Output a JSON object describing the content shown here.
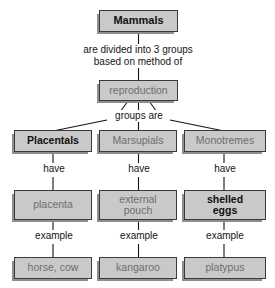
{
  "diagram": {
    "title_node": "Mammals",
    "background_color": "#ffffff",
    "box_fill_color": "#c9c9c9",
    "box_border_color": "#3a3a3a",
    "box_shadow_color": "#8e8e8e",
    "emphasis_text_color": "#111111",
    "plain_text_color": "#6e6e6e",
    "line_color": "#141414"
  },
  "nodes": {
    "root": {
      "label": "Mammals",
      "style": "emph",
      "x": 99,
      "y": 10,
      "w": 79,
      "h": 22,
      "font": 11
    },
    "reproduction": {
      "label": "reproduction",
      "style": "plain",
      "x": 99,
      "y": 80,
      "w": 79,
      "h": 21,
      "font": 10.5
    },
    "placentals": {
      "label": "Placentals",
      "style": "emph",
      "x": 14,
      "y": 130,
      "w": 78,
      "h": 22,
      "font": 10.5
    },
    "marsupials": {
      "label": "Marsupials",
      "style": "plain",
      "x": 99,
      "y": 130,
      "w": 78,
      "h": 22,
      "font": 10.5
    },
    "monotremes": {
      "label": "Monotremes",
      "style": "plain",
      "x": 184,
      "y": 130,
      "w": 82,
      "h": 22,
      "font": 10.5
    },
    "placenta": {
      "label": "placenta",
      "style": "plain",
      "x": 14,
      "y": 190,
      "w": 78,
      "h": 30,
      "font": 10.5
    },
    "external_pouch": {
      "label": "external\npouch",
      "style": "plain",
      "x": 99,
      "y": 190,
      "w": 78,
      "h": 30,
      "font": 10.5
    },
    "shelled_eggs": {
      "label": "shelled\neggs",
      "style": "emph",
      "x": 184,
      "y": 190,
      "w": 82,
      "h": 30,
      "font": 10.5
    },
    "horse_cow": {
      "label": "horse, cow",
      "style": "plain",
      "x": 14,
      "y": 257,
      "w": 78,
      "h": 22,
      "font": 10.5
    },
    "kangaroo": {
      "label": "kangaroo",
      "style": "plain",
      "x": 99,
      "y": 257,
      "w": 78,
      "h": 22,
      "font": 10.5
    },
    "platypus": {
      "label": "platypus",
      "style": "plain",
      "x": 184,
      "y": 257,
      "w": 82,
      "h": 22,
      "font": 10.5
    }
  },
  "edge_labels": {
    "root_to_reproduction": {
      "text": "are divided into 3 groups\nbased on method of",
      "x": 52,
      "y": 44,
      "w": 172
    },
    "groups_are": {
      "text": "groups are",
      "x": 108,
      "y": 110,
      "w": 62
    },
    "have_left": {
      "text": "have",
      "x": 38,
      "y": 163,
      "w": 32
    },
    "have_mid": {
      "text": "have",
      "x": 123,
      "y": 163,
      "w": 32
    },
    "have_right": {
      "text": "have",
      "x": 209,
      "y": 163,
      "w": 32
    },
    "example_left": {
      "text": "example",
      "x": 27,
      "y": 230,
      "w": 54
    },
    "example_mid": {
      "text": "example",
      "x": 112,
      "y": 230,
      "w": 54
    },
    "example_right": {
      "text": "example",
      "x": 198,
      "y": 230,
      "w": 54
    }
  }
}
